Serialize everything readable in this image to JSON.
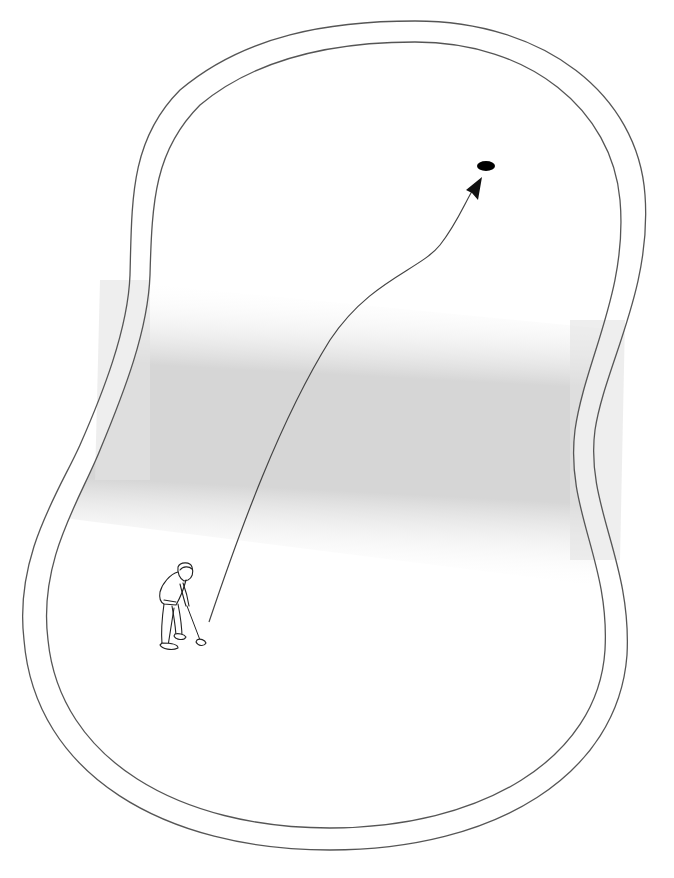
{
  "diagram": {
    "elements": {
      "green_outer_outline": "green-fringe-outer",
      "green_inner_outline": "green-putting-surface",
      "slope_band": "shaded-slope-band",
      "putt_path": "curved-putt-line-with-arrow",
      "hole": "cup",
      "golfer": "golfer-putting-icon"
    },
    "colors": {
      "line": "#555555",
      "shade": "#d9d9d9",
      "hole": "#000000",
      "background": "#ffffff"
    }
  }
}
